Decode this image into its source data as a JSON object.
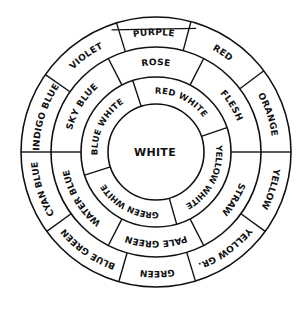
{
  "diagram": {
    "type": "concentric color wheel",
    "center": {
      "x": 156,
      "y": 152
    },
    "radii": {
      "outer": 135,
      "ring1": 105,
      "ring2": 75,
      "inner": 48
    },
    "line_color": "#111111",
    "background": "#ffffff",
    "center_label": "WHITE",
    "top_chord": {
      "angle_from": 340,
      "angle_to": 18,
      "radius": 130
    },
    "outer_ring": {
      "segments": [
        {
          "label": "PURPLE",
          "start": 343,
          "end": 15
        },
        {
          "label": "RED",
          "start": 15,
          "end": 53
        },
        {
          "label": "ORANGE",
          "start": 53,
          "end": 90
        },
        {
          "label": "YELLOW",
          "start": 90,
          "end": 126
        },
        {
          "label": "YELLOW GR.",
          "start": 126,
          "end": 163
        },
        {
          "label": "GREEN",
          "start": 163,
          "end": 196
        },
        {
          "label": "BLUE GREEN",
          "start": 196,
          "end": 234
        },
        {
          "label": "CYAN BLUE",
          "start": 234,
          "end": 270
        },
        {
          "label": "INDIGO BLUE",
          "start": 270,
          "end": 305
        },
        {
          "label": "VIOLET",
          "start": 305,
          "end": 343
        }
      ]
    },
    "middle_ring": {
      "segments": [
        {
          "label": "ROSE",
          "start": 333,
          "end": 27
        },
        {
          "label": "FLESH",
          "start": 27,
          "end": 90
        },
        {
          "label": "STRAW",
          "start": 90,
          "end": 153
        },
        {
          "label": "PALE GREEN",
          "start": 153,
          "end": 207
        },
        {
          "label": "WATER BLUE",
          "start": 207,
          "end": 270
        },
        {
          "label": "SKY BLUE",
          "start": 270,
          "end": 333
        }
      ]
    },
    "inner_ring": {
      "segments": [
        {
          "label": "RED WHITE",
          "start": 342,
          "end": 71
        },
        {
          "label": "YELLOW WHITE",
          "start": 71,
          "end": 164
        },
        {
          "label": "GREEN WHITE",
          "start": 164,
          "end": 252
        },
        {
          "label": "BLUE WHITE",
          "start": 252,
          "end": 342
        }
      ]
    }
  }
}
